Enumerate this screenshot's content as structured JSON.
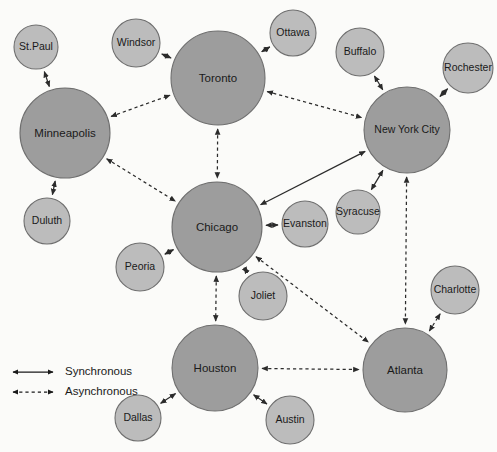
{
  "diagram": {
    "background_color": "#fbfbf9",
    "hub_color": "#9d9d9d",
    "leaf_color": "#bcbcbc",
    "node_stroke_color": "#6f6f6f",
    "edge_color": "#2b2b2b"
  },
  "nodes": [
    {
      "id": "stpaul",
      "label": "St.Paul",
      "x": 36,
      "y": 47,
      "r": 22,
      "kind": "leaf",
      "font_size": 10.5
    },
    {
      "id": "windsor",
      "label": "Windsor",
      "x": 136,
      "y": 43,
      "r": 24,
      "kind": "leaf",
      "font_size": 10.5
    },
    {
      "id": "toronto",
      "label": "Toronto",
      "x": 218,
      "y": 78,
      "r": 47,
      "kind": "hub",
      "font_size": 11.5
    },
    {
      "id": "ottawa",
      "label": "Ottawa",
      "x": 293,
      "y": 33,
      "r": 23,
      "kind": "leaf",
      "font_size": 10.5
    },
    {
      "id": "buffalo",
      "label": "Buffalo",
      "x": 360,
      "y": 52,
      "r": 24,
      "kind": "leaf",
      "font_size": 10.5
    },
    {
      "id": "rochester",
      "label": "Rochester",
      "x": 468,
      "y": 68,
      "r": 25,
      "kind": "leaf",
      "font_size": 10.5
    },
    {
      "id": "minneapolis",
      "label": "Minneapolis",
      "x": 65,
      "y": 133,
      "r": 45,
      "kind": "hub",
      "font_size": 11.5
    },
    {
      "id": "newyork",
      "label": "New York City",
      "x": 407,
      "y": 130,
      "r": 43,
      "kind": "hub",
      "font_size": 10.5
    },
    {
      "id": "duluth",
      "label": "Duluth",
      "x": 47,
      "y": 221,
      "r": 23,
      "kind": "leaf",
      "font_size": 10.5
    },
    {
      "id": "chicago",
      "label": "Chicago",
      "x": 217,
      "y": 227,
      "r": 45,
      "kind": "hub",
      "font_size": 11.5
    },
    {
      "id": "evanston",
      "label": "Evanston",
      "x": 305,
      "y": 224,
      "r": 23,
      "kind": "leaf",
      "font_size": 10.5
    },
    {
      "id": "syracuse",
      "label": "Syracuse",
      "x": 358,
      "y": 212,
      "r": 22,
      "kind": "leaf",
      "font_size": 10.5
    },
    {
      "id": "peoria",
      "label": "Peoria",
      "x": 140,
      "y": 267,
      "r": 24,
      "kind": "leaf",
      "font_size": 10.5
    },
    {
      "id": "joliet",
      "label": "Joliet",
      "x": 263,
      "y": 296,
      "r": 24,
      "kind": "leaf",
      "font_size": 10.5
    },
    {
      "id": "charlotte",
      "label": "Charlotte",
      "x": 455,
      "y": 290,
      "r": 24,
      "kind": "leaf",
      "font_size": 10.5
    },
    {
      "id": "houston",
      "label": "Houston",
      "x": 215,
      "y": 368,
      "r": 43,
      "kind": "hub",
      "font_size": 11.5
    },
    {
      "id": "atlanta",
      "label": "Atlanta",
      "x": 405,
      "y": 370,
      "r": 42,
      "kind": "hub",
      "font_size": 11.5
    },
    {
      "id": "dallas",
      "label": "Dallas",
      "x": 138,
      "y": 418,
      "r": 23,
      "kind": "leaf",
      "font_size": 10.5
    },
    {
      "id": "austin",
      "label": "Austin",
      "x": 290,
      "y": 420,
      "r": 24,
      "kind": "leaf",
      "font_size": 10.5
    }
  ],
  "edges": [
    {
      "from": "minneapolis",
      "to": "stpaul",
      "type": "synchronous"
    },
    {
      "from": "minneapolis",
      "to": "duluth",
      "type": "synchronous"
    },
    {
      "from": "toronto",
      "to": "windsor",
      "type": "synchronous"
    },
    {
      "from": "toronto",
      "to": "ottawa",
      "type": "synchronous"
    },
    {
      "from": "newyork",
      "to": "buffalo",
      "type": "synchronous"
    },
    {
      "from": "newyork",
      "to": "rochester",
      "type": "synchronous"
    },
    {
      "from": "newyork",
      "to": "syracuse",
      "type": "synchronous"
    },
    {
      "from": "chicago",
      "to": "evanston",
      "type": "synchronous"
    },
    {
      "from": "chicago",
      "to": "peoria",
      "type": "synchronous"
    },
    {
      "from": "chicago",
      "to": "joliet",
      "type": "synchronous"
    },
    {
      "from": "chicago",
      "to": "newyork",
      "type": "synchronous"
    },
    {
      "from": "houston",
      "to": "dallas",
      "type": "synchronous"
    },
    {
      "from": "houston",
      "to": "austin",
      "type": "synchronous"
    },
    {
      "from": "minneapolis",
      "to": "toronto",
      "type": "asynchronous"
    },
    {
      "from": "minneapolis",
      "to": "chicago",
      "type": "asynchronous"
    },
    {
      "from": "toronto",
      "to": "newyork",
      "type": "asynchronous"
    },
    {
      "from": "toronto",
      "to": "chicago",
      "type": "asynchronous"
    },
    {
      "from": "chicago",
      "to": "houston",
      "type": "asynchronous"
    },
    {
      "from": "chicago",
      "to": "atlanta",
      "type": "asynchronous"
    },
    {
      "from": "newyork",
      "to": "atlanta",
      "type": "asynchronous"
    },
    {
      "from": "houston",
      "to": "atlanta",
      "type": "asynchronous"
    },
    {
      "from": "atlanta",
      "to": "charlotte",
      "type": "asynchronous"
    }
  ],
  "legend": {
    "x": 10,
    "y": 368,
    "items": [
      {
        "id": "synchronous",
        "label": "Synchronous",
        "line": "solid",
        "y": 372
      },
      {
        "id": "asynchronous",
        "label": "Asynchronous",
        "line": "dashed",
        "y": 392
      }
    ]
  }
}
